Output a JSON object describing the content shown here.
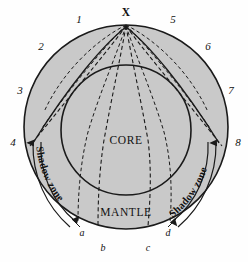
{
  "figure": {
    "title_text": "",
    "source_label": "X",
    "regions": {
      "core": "CORE",
      "mantle": "MANTLE"
    },
    "shadow_zone_left": "Shadow zone",
    "shadow_zone_right": "Shadow zone",
    "ray_numbers": [
      "1",
      "2",
      "3",
      "4",
      "5",
      "6",
      "7",
      "8"
    ],
    "surface_points": [
      "a",
      "b",
      "c",
      "d"
    ],
    "colors": {
      "mantle_fill": "#c9c9c9",
      "core_fill": "#c9c9c9",
      "outline": "#1a1a1a",
      "background": "#fefefe",
      "text": "#111111"
    },
    "geometry": {
      "earth_center_x": 126,
      "earth_center_y": 127,
      "earth_radius": 102,
      "core_center_x": 126,
      "core_center_y": 130,
      "core_radius": 65,
      "source_x": 126,
      "source_y": 25
    }
  },
  "label_positions": {
    "ray_numbers": [
      {
        "text": "1",
        "x": 74,
        "y": 18
      },
      {
        "text": "2",
        "x": 36,
        "y": 45
      },
      {
        "text": "3",
        "x": 15,
        "y": 88
      },
      {
        "text": "4",
        "x": 8,
        "y": 140
      },
      {
        "text": "5",
        "x": 169,
        "y": 18
      },
      {
        "text": "6",
        "x": 203,
        "y": 45
      },
      {
        "text": "7",
        "x": 226,
        "y": 88
      },
      {
        "text": "8",
        "x": 232,
        "y": 140
      }
    ],
    "surface_points": [
      {
        "text": "a",
        "x": 79,
        "y": 228
      },
      {
        "text": "b",
        "x": 99,
        "y": 243
      },
      {
        "text": "c",
        "x": 144,
        "y": 243
      },
      {
        "text": "d",
        "x": 166,
        "y": 228
      }
    ]
  }
}
